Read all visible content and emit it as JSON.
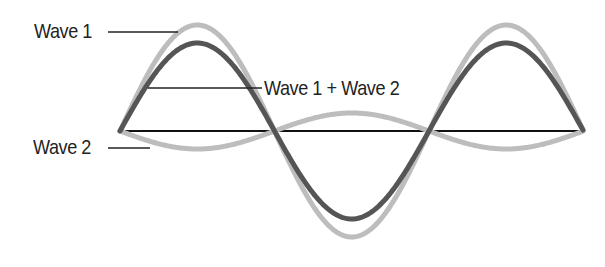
{
  "diagram": {
    "labels": {
      "wave1": "Wave 1",
      "wave2": "Wave 2",
      "sum": "Wave 1 + Wave 2"
    },
    "colors": {
      "wave1": "#bdbdbd",
      "wave2": "#bdbdbd",
      "sum": "#555555",
      "baseline": "#111111",
      "leader": "#222222",
      "text": "#222222"
    },
    "geometry": {
      "baseline_y": 131,
      "x_start": 120,
      "x_end": 583,
      "wave1_amplitude": 106,
      "wave2_amplitude": 18,
      "period_px": 309
    }
  }
}
